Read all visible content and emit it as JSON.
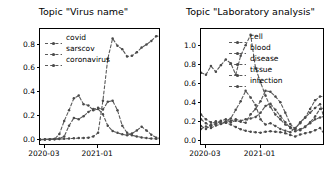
{
  "figure": {
    "width": 334,
    "height": 177,
    "background": "#ffffff",
    "line_color": "#5a5a5a",
    "marker_color": "#4a4a4a",
    "axis_color": "#000000"
  },
  "chart_data": [
    {
      "type": "line",
      "panel": "left",
      "title": "Topic \"Virus name\"",
      "xlabel": "",
      "ylabel": "",
      "grid": false,
      "legend_position": "upper left",
      "linestyle": "dashed",
      "marker": "point",
      "xlim": [
        0,
        25
      ],
      "ylim": [
        -0.05,
        0.93
      ],
      "yticks": [
        0.0,
        0.2,
        0.4,
        0.6,
        0.8
      ],
      "ytick_labels": [
        "0.0",
        "0.2",
        "0.4",
        "0.6",
        "0.8"
      ],
      "xticks": [
        1,
        12
      ],
      "xtick_labels": [
        "2020-03",
        "2021-01"
      ],
      "x": [
        0,
        1,
        2,
        3,
        4,
        5,
        6,
        7,
        8,
        9,
        10,
        11,
        12,
        13,
        14,
        15,
        16,
        17,
        18,
        19,
        20,
        21,
        22,
        23,
        24,
        25
      ],
      "series": [
        {
          "name": "covid",
          "values": [
            0.003,
            0.004,
            0.005,
            0.006,
            0.008,
            0.01,
            0.012,
            0.014,
            0.016,
            0.018,
            0.02,
            0.03,
            0.06,
            0.33,
            0.68,
            0.85,
            0.79,
            0.76,
            0.7,
            0.705,
            0.735,
            0.775,
            0.8,
            0.83,
            0.87,
            0.87
          ]
        },
        {
          "name": "sarscov",
          "values": [
            0.004,
            0.005,
            0.006,
            0.008,
            0.05,
            0.16,
            0.25,
            0.35,
            0.372,
            0.3,
            0.29,
            0.25,
            0.26,
            0.215,
            0.12,
            0.075,
            0.06,
            0.048,
            0.04,
            0.055,
            0.08,
            0.112,
            0.08,
            0.045,
            0.02,
            0.012
          ]
        },
        {
          "name": "coronavirus",
          "values": [
            0.005,
            0.006,
            0.007,
            0.009,
            0.012,
            0.03,
            0.12,
            0.185,
            0.175,
            0.2,
            0.235,
            0.26,
            0.27,
            0.255,
            0.32,
            0.33,
            0.25,
            0.12,
            0.06,
            0.04,
            0.03,
            0.022,
            0.016,
            0.012,
            0.01,
            0.008
          ]
        }
      ]
    },
    {
      "type": "line",
      "panel": "right",
      "title": "Topic \"Laboratory analysis\"",
      "xlabel": "",
      "ylabel": "",
      "grid": false,
      "legend_position": "upper right",
      "linestyle": "dashed",
      "marker": "point",
      "xlim": [
        0,
        25
      ],
      "ylim": [
        -0.05,
        1.18
      ],
      "yticks": [
        0.0,
        0.2,
        0.4,
        0.6,
        0.8,
        1.0
      ],
      "ytick_labels": [
        "0.0",
        "0.2",
        "0.4",
        "0.6",
        "0.8",
        "1.0"
      ],
      "xticks": [
        1,
        12
      ],
      "xtick_labels": [
        "2020-03",
        "2021-01"
      ],
      "x": [
        0,
        1,
        2,
        3,
        4,
        5,
        6,
        7,
        8,
        9,
        10,
        11,
        12,
        13,
        14,
        15,
        16,
        17,
        18,
        19,
        20,
        21,
        22,
        23,
        24,
        25
      ],
      "series": [
        {
          "name": "cell",
          "values": [
            0.72,
            0.7,
            0.79,
            0.73,
            0.8,
            0.86,
            0.82,
            0.7,
            0.9,
            1.01,
            1.12,
            0.77,
            0.62,
            0.48,
            0.36,
            0.28,
            0.23,
            0.175,
            0.15,
            0.13,
            0.2,
            0.25,
            0.34,
            0.43,
            0.47,
            0.47
          ]
        },
        {
          "name": "blood",
          "values": [
            0.16,
            0.13,
            0.175,
            0.21,
            0.185,
            0.21,
            0.24,
            0.33,
            0.42,
            0.53,
            0.46,
            0.38,
            0.23,
            0.175,
            0.19,
            0.16,
            0.13,
            0.11,
            0.095,
            0.14,
            0.19,
            0.25,
            0.3,
            0.35,
            0.39,
            0.21
          ]
        },
        {
          "name": "disease",
          "values": [
            0.28,
            0.23,
            0.2,
            0.19,
            0.215,
            0.23,
            0.2,
            0.215,
            0.205,
            0.195,
            0.285,
            0.34,
            0.42,
            0.53,
            0.52,
            0.47,
            0.41,
            0.3,
            0.18,
            0.13,
            0.115,
            0.15,
            0.2,
            0.26,
            0.34,
            0.355
          ]
        },
        {
          "name": "tissue",
          "values": [
            0.13,
            0.155,
            0.14,
            0.165,
            0.18,
            0.195,
            0.215,
            0.23,
            0.215,
            0.23,
            0.24,
            0.255,
            0.3,
            0.37,
            0.395,
            0.33,
            0.265,
            0.2,
            0.14,
            0.105,
            0.125,
            0.155,
            0.19,
            0.23,
            0.25,
            0.265
          ]
        },
        {
          "name": "infection",
          "values": [
            0.23,
            0.19,
            0.16,
            0.185,
            0.205,
            0.195,
            0.175,
            0.15,
            0.125,
            0.11,
            0.1,
            0.095,
            0.09,
            0.1,
            0.105,
            0.1,
            0.095,
            0.085,
            0.065,
            0.05,
            0.07,
            0.085,
            0.095,
            0.115,
            0.14,
            0.065
          ]
        }
      ]
    }
  ]
}
